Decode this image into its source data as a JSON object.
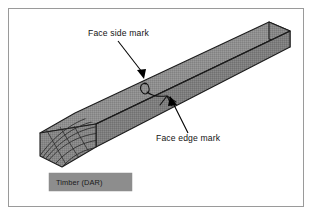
{
  "figure": {
    "border_color": "#9a9a9a",
    "background": "#ffffff"
  },
  "annotations": [
    {
      "id": "face-side-mark",
      "label": "Face side mark",
      "text_x": 88,
      "text_y": 36,
      "leader_from": [
        118,
        41
      ],
      "leader_to": [
        144,
        76
      ],
      "arrow_angle_deg": 54
    },
    {
      "id": "face-edge-mark",
      "label": "Face edge mark",
      "text_x": 156,
      "text_y": 141,
      "leader_from": [
        188,
        133
      ],
      "leader_to": [
        170,
        98
      ],
      "arrow_angle_deg": 243
    }
  ],
  "caption": {
    "label": "Timber (DAR)",
    "box_x": 49,
    "box_y": 173,
    "box_w": 83,
    "box_h": 18,
    "fill": "#8d8d8d",
    "text_color": "#1a1a1a"
  },
  "timber": {
    "description": "Isometric dressed-all-round timber board with end grain rings",
    "top_face_color": "#8c8c8c",
    "front_face_color": "#7b7b7b",
    "end_face_color": "#828282",
    "outline_color": "#1c1c1c",
    "grain_ring_color": "#2e2e2e",
    "mark_color": "#111111",
    "arrow_color": "#000000"
  },
  "marks": {
    "face_side_mark": "looped pencil mark on the face side running to the arris",
    "face_edge_mark": "inverted-V pencil mark on the face edge meeting the arris"
  }
}
